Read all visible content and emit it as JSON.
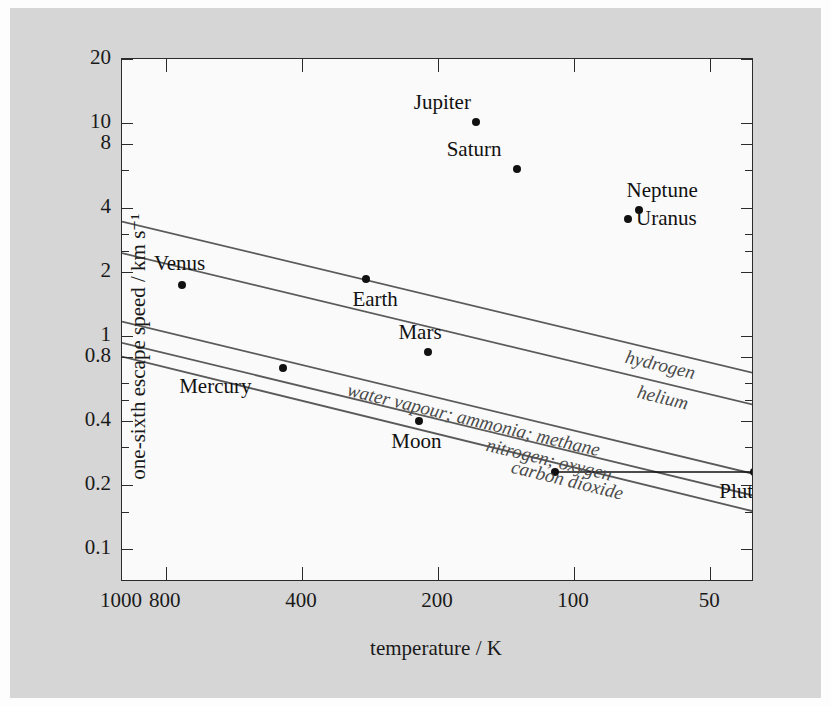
{
  "chart_data": {
    "type": "scatter",
    "title": "",
    "xlabel": "temperature / K",
    "ylabel": "one-sixth escape speed / km s⁻¹",
    "xscale": "log-reversed",
    "yscale": "log",
    "xlim": [
      1000,
      40
    ],
    "ylim": [
      0.07,
      20
    ],
    "grid": false,
    "legend_position": "inline-curve-labels",
    "xticks": [
      {
        "value": 1000,
        "label": "1000"
      },
      {
        "value": 800,
        "label": "800"
      },
      {
        "value": 400,
        "label": "400"
      },
      {
        "value": 200,
        "label": "200"
      },
      {
        "value": 100,
        "label": "100"
      },
      {
        "value": 50,
        "label": "50"
      }
    ],
    "yticks": [
      {
        "value": 20,
        "label": "20"
      },
      {
        "value": 10,
        "label": "10"
      },
      {
        "value": 8,
        "label": "8"
      },
      {
        "value": 4,
        "label": "4"
      },
      {
        "value": 2,
        "label": "2"
      },
      {
        "value": 1,
        "label": "1"
      },
      {
        "value": 0.8,
        "label": "0.8"
      },
      {
        "value": 0.4,
        "label": "0.4"
      },
      {
        "value": 0.2,
        "label": "0.2"
      },
      {
        "value": 0.1,
        "label": "0.1"
      }
    ],
    "yticks_minor": [
      6,
      3,
      2.5,
      0.6,
      0.5,
      0.3,
      0.15
    ],
    "points": [
      {
        "name": "Jupiter",
        "temperature": 165,
        "escape_speed_sixth": 10.1,
        "label_dx": -62,
        "label_dy": -30
      },
      {
        "name": "Saturn",
        "temperature": 134,
        "escape_speed_sixth": 6.1,
        "label_dx": -70,
        "label_dy": -30
      },
      {
        "name": "Neptune",
        "temperature": 72,
        "escape_speed_sixth": 3.9,
        "label_dx": -12,
        "label_dy": -30
      },
      {
        "name": "Uranus",
        "temperature": 76,
        "escape_speed_sixth": 3.55,
        "label_dx": 8,
        "label_dy": -11
      },
      {
        "name": "Earth",
        "temperature": 288,
        "escape_speed_sixth": 1.86,
        "label_dx": -14,
        "label_dy": 10
      },
      {
        "name": "Venus",
        "temperature": 737,
        "escape_speed_sixth": 1.73,
        "label_dx": -28,
        "label_dy": -32
      },
      {
        "name": "Mars",
        "temperature": 210,
        "escape_speed_sixth": 0.84,
        "label_dx": -30,
        "label_dy": -30
      },
      {
        "name": "Mercury",
        "temperature": 440,
        "escape_speed_sixth": 0.71,
        "label_dx": -104,
        "label_dy": 8
      },
      {
        "name": "Moon",
        "temperature": 220,
        "escape_speed_sixth": 0.4,
        "label_dx": -28,
        "label_dy": 10
      },
      {
        "name": "Pluto",
        "temperature": 44,
        "escape_speed_sixth": 0.23,
        "label_dx": -16,
        "label_dy": 9,
        "range_bar": true,
        "range_temp_min": 40,
        "range_temp_max": 110
      }
    ],
    "curves": [
      {
        "name": "hydrogen",
        "label": "hydrogen",
        "y_at_1000K": 3.45,
        "y_at_40K": 0.67
      },
      {
        "name": "helium",
        "label": "helium",
        "y_at_1000K": 2.45,
        "y_at_40K": 0.475
      },
      {
        "name": "water vapour; ammonia; methane",
        "label": "water vapour; ammonia; methane",
        "y_at_1000K": 1.17,
        "y_at_40K": 0.225
      },
      {
        "name": "nitrogen; oxygen",
        "label": "nitrogen; oxygen",
        "y_at_1000K": 0.93,
        "y_at_40K": 0.178
      },
      {
        "name": "carbon dioxide",
        "label": "carbon dioxide",
        "y_at_1000K": 0.8,
        "y_at_40K": 0.15
      }
    ]
  }
}
